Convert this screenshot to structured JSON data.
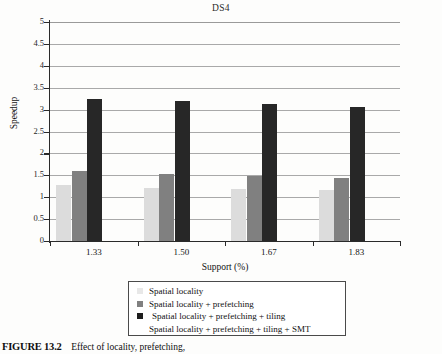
{
  "chart_data": {
    "type": "bar",
    "title": "DS4",
    "xlabel": "Support (%)",
    "ylabel": "Speedup",
    "categories": [
      "1.33",
      "1.50",
      "1.67",
      "1.83"
    ],
    "ylim": [
      0,
      5
    ],
    "ytick_labels": [
      "0",
      "0.5",
      "1",
      "1.5",
      "2",
      "2.5",
      "3",
      "3.5",
      "4",
      "4.5",
      "5"
    ],
    "ytick_values": [
      0,
      0.5,
      1,
      1.5,
      2,
      2.5,
      3,
      3.5,
      4,
      4.5,
      5
    ],
    "grid": true,
    "grid_axis": "y",
    "legend_position": "below-plot",
    "series": [
      {
        "name": "Spatial locality",
        "color": "#dcdcdc",
        "values": [
          1.27,
          1.22,
          1.19,
          1.16
        ]
      },
      {
        "name": "Spatial locality + prefetching",
        "color": "#808080",
        "values": [
          1.6,
          1.53,
          1.49,
          1.45
        ]
      },
      {
        "name": "Spatial locality + prefetching + tiling",
        "color": "#272727",
        "values": [
          3.25,
          3.2,
          3.13,
          3.06
        ]
      },
      {
        "name": "Spatial locality + prefetching + tiling + SMT",
        "color": "#dcdcdc",
        "values": [
          0,
          0,
          0,
          0
        ]
      }
    ]
  },
  "caption": {
    "figure_number": "FIGURE 13.2",
    "text": "Effect of locality, prefetching,"
  }
}
